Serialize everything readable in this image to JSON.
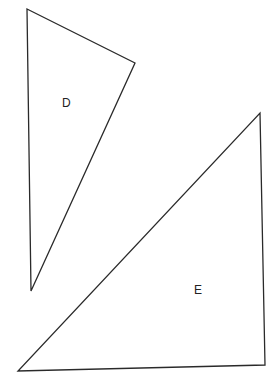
{
  "diagram": {
    "shapes": [
      {
        "label": "D",
        "type": "triangle",
        "points": [
          [
            27,
            9
          ],
          [
            135,
            63
          ],
          [
            31,
            291
          ]
        ],
        "label_pos": [
          62,
          107
        ]
      },
      {
        "label": "E",
        "type": "triangle",
        "points": [
          [
            260,
            113
          ],
          [
            265,
            365
          ],
          [
            18,
            371
          ]
        ],
        "label_pos": [
          194,
          294
        ]
      }
    ],
    "stroke_color": "#2a2a2a",
    "background": "#ffffff"
  }
}
